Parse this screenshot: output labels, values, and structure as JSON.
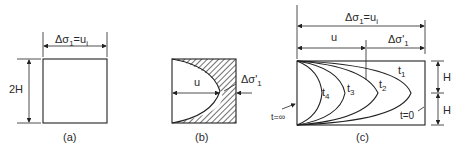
{
  "figure": {
    "panel_a": {
      "caption": "(a)",
      "top_label": "Δσ",
      "top_label_sub": "1",
      "top_label_rest": "=u",
      "top_label_sub2": "i",
      "height_label": "2H"
    },
    "panel_b": {
      "caption": "(b)",
      "u_label": "u",
      "stress_label": "Δσ'",
      "stress_label_sub": "1"
    },
    "panel_c": {
      "caption": "(c)",
      "top_label": "Δσ",
      "top_label_sub": "1",
      "top_label_rest": "=u",
      "top_label_sub2": "i",
      "u_label": "u",
      "stress_label": "Δσ'",
      "stress_label_sub": "1",
      "curves": [
        {
          "label": "t",
          "sub": "1"
        },
        {
          "label": "t",
          "sub": "2"
        },
        {
          "label": "t",
          "sub": "3"
        },
        {
          "label": "t",
          "sub": "4"
        }
      ],
      "t_inf_label": "t=∞",
      "t_zero_label": "t=0",
      "h_upper": "H",
      "h_lower": "H"
    }
  }
}
